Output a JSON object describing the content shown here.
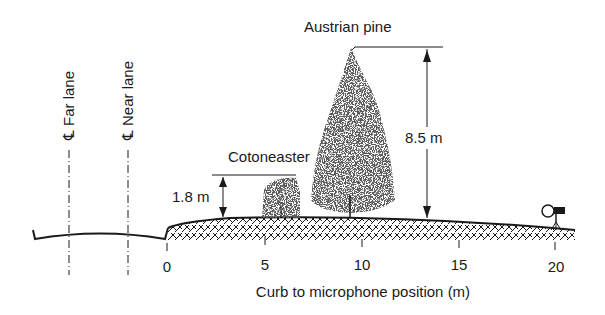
{
  "diagram": {
    "type": "cross-section",
    "xlabel": "Curb to microphone position (m)",
    "ticks": [
      {
        "value": "0",
        "x": 167
      },
      {
        "value": "5",
        "x": 265
      },
      {
        "value": "10",
        "x": 362
      },
      {
        "value": "15",
        "x": 459
      },
      {
        "value": "20",
        "x": 555
      }
    ],
    "lanes": [
      {
        "symbol": "℄",
        "label": "Far lane",
        "x": 69
      },
      {
        "symbol": "℄",
        "label": "Near lane",
        "x": 128
      }
    ],
    "plants": [
      {
        "name": "Cotoneaster",
        "height_label": "1.8 m",
        "position_m": 6
      },
      {
        "name": "Austrian pine",
        "height_label": "8.5 m",
        "position_m": 9.5
      }
    ],
    "microphone": {
      "position_m": 20
    },
    "colors": {
      "ink": "#1a1a1a",
      "background": "#ffffff"
    }
  }
}
